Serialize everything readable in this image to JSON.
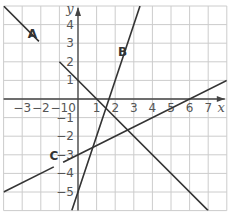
{
  "chart_data": {
    "type": "line",
    "title": "",
    "xlabel": "x",
    "ylabel": "y",
    "xlim": [
      -4,
      8
    ],
    "ylim": [
      -6,
      5
    ],
    "grid": true,
    "x_ticks": [
      "-3",
      "-2",
      "-1",
      "0",
      "1",
      "2",
      "3",
      "4",
      "5",
      "6",
      "7"
    ],
    "y_ticks": [
      "4",
      "3",
      "2",
      "1",
      "-1",
      "-2",
      "-3",
      "-4",
      "-5"
    ],
    "series": [
      {
        "name": "A",
        "equation": "y = 1 - x",
        "points": [
          [
            -4,
            5
          ],
          [
            7,
            -6
          ]
        ]
      },
      {
        "name": "B",
        "equation": "y = 3x - 5",
        "points": [
          [
            -0.333,
            -6
          ],
          [
            3.333,
            5
          ]
        ]
      },
      {
        "name": "C",
        "equation": "y = 0.5x - 3",
        "points": [
          [
            -4,
            -5
          ],
          [
            8,
            1
          ]
        ]
      }
    ],
    "labels": {
      "A": "A",
      "B": "B",
      "C": "C"
    },
    "colors": {
      "grid": "#cccccc",
      "axis": "#444444",
      "line": "#333333"
    }
  }
}
